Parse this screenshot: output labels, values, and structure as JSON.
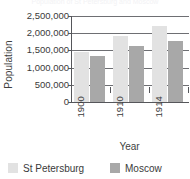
{
  "chart_data": {
    "type": "bar",
    "title": "Population of St Petersburg and Moscow",
    "xlabel": "Year",
    "ylabel": "Population",
    "categories": [
      "1900",
      "1910",
      "1914"
    ],
    "series": [
      {
        "name": "St Petersburg",
        "color": "#e2e2e2",
        "values": [
          1440000,
          1910000,
          2220000
        ]
      },
      {
        "name": "Moscow",
        "color": "#a8a8a8",
        "values": [
          1340000,
          1620000,
          1760000
        ]
      }
    ],
    "ylim": [
      0,
      2500000
    ],
    "y_ticks": [
      {
        "value": 2500000,
        "label": "2,500,000"
      },
      {
        "value": 2000000,
        "label": "2,000,000"
      },
      {
        "value": 1500000,
        "label": "1,500,000"
      },
      {
        "value": 1000000,
        "label": "1,000,000"
      },
      {
        "value": 500000,
        "label": "500,000"
      },
      {
        "value": 0,
        "label": "0"
      }
    ],
    "grid": true,
    "legend_position": "bottom"
  },
  "legend": {
    "items": [
      {
        "label": "St Petersburg",
        "color": "#e2e2e2"
      },
      {
        "label": "Moscow",
        "color": "#a8a8a8"
      }
    ]
  }
}
